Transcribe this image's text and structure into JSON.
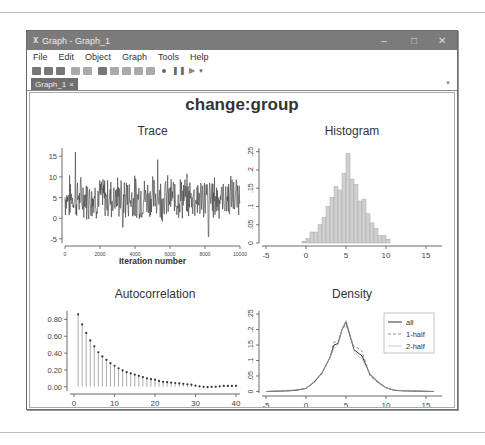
{
  "window": {
    "title": "Graph - Graph_1",
    "controls": {
      "minimize": "–",
      "maximize": "□",
      "close": "✕"
    }
  },
  "menu": [
    "File",
    "Edit",
    "Object",
    "Graph",
    "Tools",
    "Help"
  ],
  "toolbar": {
    "icons": [
      "open-icon",
      "save-icon",
      "print-icon",
      "copy-icon",
      "paste-icon",
      "edit-graph-icon",
      "select-icon",
      "pointer-icon",
      "rewind-icon",
      "back-icon",
      "record-icon",
      "pause-icon",
      "play-icon",
      "more-icon"
    ]
  },
  "tabs": [
    {
      "label": "Graph_1",
      "close": "×",
      "active": true
    }
  ],
  "graph": {
    "main_title": "change:group"
  },
  "chart_data": [
    {
      "type": "line",
      "title": "Trace",
      "xlabel": "Iteration number",
      "ylabel": "",
      "xlim": [
        0,
        10000
      ],
      "ylim": [
        -6,
        17
      ],
      "xticks": [
        "0",
        "2000",
        "4000",
        "6000",
        "8000",
        "10000"
      ],
      "yticks": [
        "-5",
        "0",
        "5",
        "10",
        "15"
      ],
      "notes": "MCMC trace fluctuating around ~5, mostly between 0 and 10; spikes near 16 (iter ~600) and ~14 (iter ~5300), min ~-4.5 near iter ~8200"
    },
    {
      "type": "bar",
      "title": "Histogram",
      "xlabel": "",
      "ylabel": "",
      "xlim": [
        -5.5,
        17
      ],
      "ylim": [
        0,
        0.26
      ],
      "xticks": [
        "-5",
        "0",
        "5",
        "10",
        "15"
      ],
      "yticks": [
        "0",
        ".05",
        ".1",
        ".15",
        ".2",
        ".25"
      ],
      "bin_starts": [
        -0.5,
        0,
        0.5,
        1,
        1.5,
        2,
        2.5,
        3,
        3.5,
        4,
        4.5,
        5,
        5.5,
        6,
        6.5,
        7,
        7.5,
        8,
        8.5,
        9,
        9.5,
        10
      ],
      "values": [
        0.005,
        0.012,
        0.03,
        0.03,
        0.05,
        0.07,
        0.1,
        0.125,
        0.155,
        0.145,
        0.19,
        0.245,
        0.175,
        0.16,
        0.115,
        0.12,
        0.08,
        0.055,
        0.04,
        0.02,
        0.02,
        0.01
      ]
    },
    {
      "type": "scatter",
      "title": "Autocorrelation",
      "xlabel": "Lag",
      "ylabel": "",
      "xlim": [
        -1,
        41
      ],
      "ylim": [
        -0.05,
        0.9
      ],
      "xticks": [
        "0",
        "10",
        "20",
        "30",
        "40"
      ],
      "yticks": [
        "0.00",
        "0.20",
        "0.40",
        "0.60",
        "0.80"
      ],
      "x": [
        1,
        2,
        3,
        4,
        5,
        6,
        7,
        8,
        9,
        10,
        11,
        12,
        13,
        14,
        15,
        16,
        17,
        18,
        19,
        20,
        21,
        22,
        23,
        24,
        25,
        26,
        27,
        28,
        29,
        30,
        31,
        32,
        33,
        34,
        35,
        36,
        37,
        38,
        39,
        40
      ],
      "values": [
        0.86,
        0.74,
        0.64,
        0.55,
        0.48,
        0.41,
        0.36,
        0.32,
        0.28,
        0.25,
        0.22,
        0.195,
        0.175,
        0.16,
        0.145,
        0.13,
        0.115,
        0.1,
        0.09,
        0.085,
        0.07,
        0.06,
        0.055,
        0.05,
        0.045,
        0.04,
        0.035,
        0.03,
        0.025,
        0.015,
        0.005,
        0.0,
        -0.005,
        0.0,
        0.0,
        0.005,
        0.01,
        0.01,
        0.01,
        0.01
      ]
    },
    {
      "type": "line",
      "title": "Density",
      "xlabel": "",
      "ylabel": "",
      "xlim": [
        -5.5,
        17
      ],
      "ylim": [
        -0.005,
        0.26
      ],
      "xticks": [
        "-5",
        "0",
        "5",
        "10",
        "15"
      ],
      "yticks": [
        "0",
        ".05",
        ".1",
        ".15",
        ".2",
        ".25"
      ],
      "legend": [
        "all",
        "1-half",
        "2-half"
      ],
      "legend_position": "top-right",
      "series": [
        {
          "name": "all",
          "x": [
            -5,
            -2,
            -1,
            0,
            1,
            2,
            3,
            3.5,
            4,
            4.5,
            5,
            5.5,
            6,
            6.5,
            7,
            7.5,
            8,
            9,
            10,
            11,
            12,
            16
          ],
          "values": [
            0,
            0.002,
            0.005,
            0.01,
            0.03,
            0.06,
            0.11,
            0.15,
            0.155,
            0.2,
            0.225,
            0.18,
            0.135,
            0.125,
            0.115,
            0.085,
            0.055,
            0.03,
            0.012,
            0.004,
            0.002,
            0.0
          ]
        },
        {
          "name": "1-half",
          "x": [
            -5,
            -1,
            0,
            1,
            2,
            3,
            3.5,
            4,
            4.5,
            5,
            5.5,
            6,
            6.5,
            7,
            7.5,
            8,
            9,
            10,
            11,
            16
          ],
          "values": [
            0,
            0.004,
            0.01,
            0.028,
            0.058,
            0.11,
            0.16,
            0.16,
            0.2,
            0.215,
            0.18,
            0.145,
            0.14,
            0.13,
            0.09,
            0.05,
            0.028,
            0.012,
            0.003,
            0.0
          ]
        },
        {
          "name": "2-half",
          "x": [
            -5,
            -1,
            0,
            1,
            2,
            3,
            3.5,
            4,
            4.5,
            5,
            5.5,
            6,
            6.5,
            7,
            7.5,
            8,
            9,
            10,
            11,
            16
          ],
          "values": [
            0,
            0.006,
            0.01,
            0.032,
            0.062,
            0.11,
            0.14,
            0.15,
            0.2,
            0.23,
            0.185,
            0.13,
            0.115,
            0.105,
            0.08,
            0.058,
            0.032,
            0.012,
            0.004,
            0.0
          ]
        }
      ]
    }
  ]
}
